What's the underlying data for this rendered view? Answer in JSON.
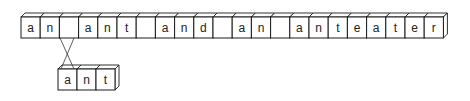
{
  "diagram": {
    "top_row": {
      "cells": [
        "a",
        "n",
        " ",
        "a",
        "n",
        "t",
        " ",
        "a",
        "n",
        "d",
        " ",
        "a",
        "n",
        " ",
        "a",
        "n",
        "t",
        "e",
        "a",
        "t",
        "e",
        "r"
      ],
      "text": "an ant and an anteater"
    },
    "bottom_row": {
      "cells": [
        "a",
        "n",
        "t"
      ],
      "text": "ant"
    },
    "link": {
      "from_top_index": 2,
      "to_bottom": "a",
      "style": "crossed-lines"
    }
  },
  "colors": {
    "stroke": "#1a1a1a",
    "fill": "#ffffff",
    "text": "#222222"
  }
}
